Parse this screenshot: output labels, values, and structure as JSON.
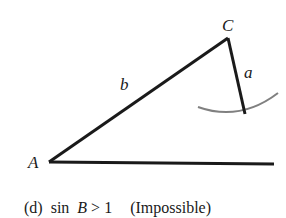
{
  "diagram": {
    "type": "triangle-ambiguous-case",
    "vertices": {
      "A": {
        "label": "A",
        "x": 49,
        "y": 162
      },
      "C": {
        "label": "C",
        "x": 228,
        "y": 38
      }
    },
    "sides": {
      "b": {
        "label": "b",
        "from": "A",
        "to": "C"
      },
      "a": {
        "label": "a",
        "from": "C",
        "x2": 245,
        "y2": 114
      }
    },
    "baseline": {
      "x1": 49,
      "y1": 162,
      "x2": 274,
      "y2": 164
    },
    "arc": {
      "description": "arc of radius a centered at C, not reaching baseline",
      "color": "#808080"
    },
    "line_color": "#1a1a1a"
  },
  "caption": {
    "part": "(d)",
    "condition_prefix": "sin",
    "condition_var": "B",
    "condition_suffix": " > 1",
    "note": "(Impossible)"
  }
}
